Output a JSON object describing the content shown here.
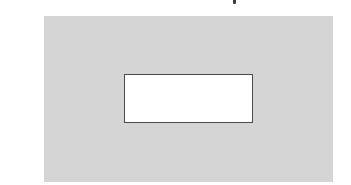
{
  "figure": {
    "type": "nested-rectangles",
    "outer_region": {
      "fill_color": "#d5d5d5",
      "label": ""
    },
    "inner_region": {
      "fill_color": "#ffffff",
      "border_color": "#4a4a4a",
      "label": ""
    },
    "cropped_text_above": ""
  }
}
